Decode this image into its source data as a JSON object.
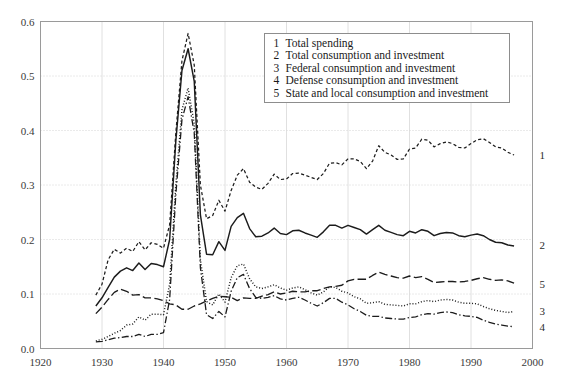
{
  "chart_data": {
    "type": "line",
    "title": "",
    "subtitle": "",
    "xlabel": "",
    "ylabel": "",
    "xlim": [
      1920,
      2000
    ],
    "ylim": [
      0.0,
      0.6
    ],
    "xticks": [
      1920,
      1930,
      1940,
      1950,
      1960,
      1970,
      1980,
      1990,
      2000
    ],
    "yticks": [
      0.0,
      0.1,
      0.2,
      0.3,
      0.4,
      0.5,
      0.6
    ],
    "xtick_labels": [
      "1920",
      "1930",
      "1940",
      "1950",
      "1960",
      "1970",
      "1980",
      "1990",
      "2000"
    ],
    "ytick_labels": [
      "0.0",
      "0.1",
      "0.2",
      "0.3",
      "0.4",
      "0.5",
      "0.6"
    ],
    "grid": true,
    "grid_style": "dotted",
    "legend_position": "top-center-right",
    "legend_entries": [
      {
        "key": "1",
        "label": "Total spending"
      },
      {
        "key": "2",
        "label": "Total consumption and investment"
      },
      {
        "key": "3",
        "label": "Federal consumption and investment"
      },
      {
        "key": "4",
        "label": "Defense consumption and investment"
      },
      {
        "key": "5",
        "label": "State and local consumption and investment"
      }
    ],
    "end_labels": [
      {
        "key": "1",
        "value": 0.355
      },
      {
        "key": "2",
        "value": 0.19
      },
      {
        "key": "5",
        "value": 0.118
      },
      {
        "key": "3",
        "value": 0.068
      },
      {
        "key": "4",
        "value": 0.04
      }
    ],
    "x": [
      1929,
      1930,
      1931,
      1932,
      1933,
      1934,
      1935,
      1936,
      1937,
      1938,
      1939,
      1940,
      1941,
      1942,
      1943,
      1944,
      1945,
      1946,
      1947,
      1948,
      1949,
      1950,
      1951,
      1952,
      1953,
      1954,
      1955,
      1956,
      1957,
      1958,
      1959,
      1960,
      1961,
      1962,
      1963,
      1964,
      1965,
      1966,
      1967,
      1968,
      1969,
      1970,
      1971,
      1972,
      1973,
      1974,
      1975,
      1976,
      1977,
      1978,
      1979,
      1980,
      1981,
      1982,
      1983,
      1984,
      1985,
      1986,
      1987,
      1988,
      1989,
      1990,
      1991,
      1992,
      1993,
      1994,
      1995,
      1996,
      1997
    ],
    "series": [
      {
        "name": "Total spending",
        "key": "1",
        "style": "short-dash",
        "color": "#1c1c1c",
        "values": [
          0.098,
          0.118,
          0.163,
          0.182,
          0.175,
          0.184,
          0.178,
          0.196,
          0.181,
          0.194,
          0.191,
          0.184,
          0.227,
          0.395,
          0.528,
          0.578,
          0.52,
          0.3,
          0.238,
          0.244,
          0.272,
          0.252,
          0.29,
          0.318,
          0.33,
          0.305,
          0.296,
          0.292,
          0.303,
          0.32,
          0.31,
          0.311,
          0.321,
          0.322,
          0.318,
          0.314,
          0.31,
          0.321,
          0.34,
          0.341,
          0.337,
          0.348,
          0.348,
          0.343,
          0.33,
          0.344,
          0.372,
          0.36,
          0.355,
          0.347,
          0.348,
          0.366,
          0.368,
          0.384,
          0.382,
          0.37,
          0.376,
          0.379,
          0.376,
          0.369,
          0.368,
          0.376,
          0.383,
          0.385,
          0.378,
          0.37,
          0.368,
          0.36,
          0.355
        ]
      },
      {
        "name": "Total consumption and investment",
        "key": "2",
        "style": "solid",
        "color": "#1c1c1c",
        "values": [
          0.078,
          0.093,
          0.112,
          0.131,
          0.142,
          0.148,
          0.143,
          0.157,
          0.145,
          0.156,
          0.154,
          0.15,
          0.2,
          0.38,
          0.51,
          0.55,
          0.49,
          0.245,
          0.173,
          0.172,
          0.196,
          0.18,
          0.224,
          0.24,
          0.248,
          0.22,
          0.205,
          0.206,
          0.212,
          0.221,
          0.211,
          0.209,
          0.216,
          0.217,
          0.212,
          0.208,
          0.204,
          0.214,
          0.226,
          0.226,
          0.221,
          0.226,
          0.222,
          0.218,
          0.21,
          0.218,
          0.226,
          0.217,
          0.213,
          0.209,
          0.207,
          0.215,
          0.212,
          0.218,
          0.215,
          0.207,
          0.211,
          0.213,
          0.212,
          0.207,
          0.205,
          0.208,
          0.21,
          0.207,
          0.2,
          0.195,
          0.194,
          0.19,
          0.188
        ]
      },
      {
        "name": "Federal consumption and investment",
        "key": "3",
        "style": "dotted",
        "color": "#1c1c1c",
        "values": [
          0.014,
          0.017,
          0.022,
          0.028,
          0.033,
          0.043,
          0.045,
          0.058,
          0.052,
          0.063,
          0.063,
          0.062,
          0.118,
          0.3,
          0.438,
          0.478,
          0.412,
          0.163,
          0.086,
          0.08,
          0.1,
          0.085,
          0.13,
          0.152,
          0.155,
          0.128,
          0.113,
          0.11,
          0.113,
          0.117,
          0.111,
          0.107,
          0.111,
          0.113,
          0.108,
          0.102,
          0.098,
          0.104,
          0.113,
          0.112,
          0.105,
          0.102,
          0.095,
          0.091,
          0.083,
          0.084,
          0.086,
          0.081,
          0.08,
          0.079,
          0.078,
          0.082,
          0.082,
          0.086,
          0.088,
          0.086,
          0.089,
          0.09,
          0.089,
          0.085,
          0.083,
          0.083,
          0.082,
          0.077,
          0.073,
          0.07,
          0.068,
          0.066,
          0.068
        ]
      },
      {
        "name": "Defense consumption and investment",
        "key": "4",
        "style": "dash-dot",
        "color": "#1c1c1c",
        "values": [
          0.012,
          0.013,
          0.016,
          0.019,
          0.02,
          0.022,
          0.022,
          0.026,
          0.022,
          0.026,
          0.026,
          0.029,
          0.09,
          0.282,
          0.42,
          0.462,
          0.395,
          0.148,
          0.062,
          0.055,
          0.068,
          0.058,
          0.105,
          0.13,
          0.136,
          0.11,
          0.094,
          0.092,
          0.094,
          0.097,
          0.091,
          0.089,
          0.092,
          0.094,
          0.089,
          0.083,
          0.078,
          0.084,
          0.092,
          0.092,
          0.085,
          0.08,
          0.073,
          0.068,
          0.061,
          0.059,
          0.059,
          0.056,
          0.055,
          0.054,
          0.054,
          0.057,
          0.058,
          0.062,
          0.064,
          0.063,
          0.066,
          0.067,
          0.066,
          0.062,
          0.06,
          0.059,
          0.057,
          0.052,
          0.048,
          0.045,
          0.043,
          0.041,
          0.04
        ]
      },
      {
        "name": "State and local consumption and investment",
        "key": "5",
        "style": "long-dash",
        "color": "#1c1c1c",
        "values": [
          0.064,
          0.076,
          0.09,
          0.103,
          0.109,
          0.105,
          0.098,
          0.099,
          0.093,
          0.093,
          0.091,
          0.088,
          0.082,
          0.08,
          0.072,
          0.072,
          0.078,
          0.082,
          0.087,
          0.092,
          0.096,
          0.095,
          0.094,
          0.088,
          0.093,
          0.092,
          0.092,
          0.096,
          0.099,
          0.104,
          0.1,
          0.102,
          0.105,
          0.104,
          0.104,
          0.106,
          0.106,
          0.11,
          0.113,
          0.114,
          0.116,
          0.124,
          0.127,
          0.127,
          0.127,
          0.134,
          0.14,
          0.136,
          0.133,
          0.13,
          0.129,
          0.133,
          0.13,
          0.132,
          0.127,
          0.121,
          0.122,
          0.123,
          0.123,
          0.122,
          0.123,
          0.125,
          0.128,
          0.13,
          0.127,
          0.125,
          0.126,
          0.124,
          0.12
        ]
      }
    ]
  }
}
